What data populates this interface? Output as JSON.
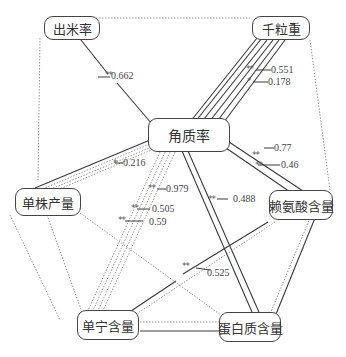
{
  "nodes": {
    "chumilv": "出米率",
    "qianlizhong": "千粒重",
    "jiaozhilv": "角质率",
    "danzhuchanliang": "单株产量",
    "laiansuan": "赖氨酸含量",
    "danning": "单宁含量",
    "danbaizhi": "蛋白质含量"
  },
  "edges": [
    {
      "from": "jiaozhilv",
      "to": "chumilv",
      "value": "0.662",
      "sig": "**",
      "style": "solid"
    },
    {
      "from": "jiaozhilv",
      "to": "qianlizhong",
      "value": "0.551",
      "sig": "**",
      "style": "solid"
    },
    {
      "from": "jiaozhilv",
      "to": "qianlizhong",
      "value": "0.178",
      "sig": "*",
      "style": "solid"
    },
    {
      "from": "jiaozhilv",
      "to": "danzhuchanliang",
      "value": "0.216",
      "sig": "*",
      "style": "solid"
    },
    {
      "from": "jiaozhilv",
      "to": "danning",
      "value": "0.979",
      "sig": "**",
      "style": "dotted"
    },
    {
      "from": "jiaozhilv",
      "to": "danning",
      "value": "0.505",
      "sig": "**",
      "style": "dotted"
    },
    {
      "from": "jiaozhilv",
      "to": "danning",
      "value": "0.59",
      "sig": "**",
      "style": "dotted"
    },
    {
      "from": "jiaozhilv",
      "to": "danbaizhi",
      "value": "0.488",
      "sig": "**",
      "style": "solid"
    },
    {
      "from": "jiaozhilv",
      "to": "laiansuan",
      "value": "0.77",
      "sig": "**",
      "style": "solid"
    },
    {
      "from": "jiaozhilv",
      "to": "laiansuan",
      "value": "0.46",
      "sig": "**",
      "style": "solid"
    },
    {
      "from": "laiansuan",
      "to": "danning",
      "value": "0.525",
      "sig": "**",
      "style": "solid"
    }
  ],
  "labels": {
    "v0662": "0.662",
    "v0551": "0.551",
    "v0178": "0.178",
    "v0216": "0.216",
    "v0979": "0.979",
    "v0505": "0.505",
    "v059": "0.59",
    "v0488": "0.488",
    "v077": "0.77",
    "v046": "0.46",
    "v0525": "0.525",
    "s2": "**",
    "s1": "*"
  },
  "colors": {
    "solid_line": "#3a3a3a",
    "dotted_line": "#8a8a8a",
    "node_border": "#444444"
  }
}
